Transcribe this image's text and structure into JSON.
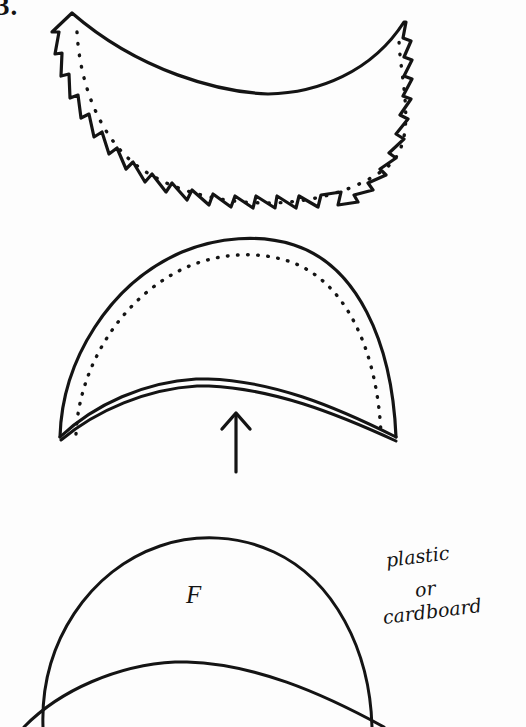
{
  "page": {
    "background_color": "#fdfdfd",
    "ink_color": "#141414",
    "width": 526,
    "height": 727
  },
  "figure_number": "3.",
  "annotations": {
    "piece_label": "F",
    "material_note_line1": "plastic",
    "material_note_line2": "or",
    "material_note_line3": "cardboard",
    "material_note_full": "plastic or cardboard",
    "arrow_label": "up-arrow"
  },
  "figures": [
    {
      "id": "figure-top",
      "name": "notched-crescent-piece",
      "description": "Crescent/bowl shaped fabric piece with smooth concave upper edge and clipped (notched) lower curved seam allowance, with dotted stitching line inside",
      "has_dotted_seam_line": true,
      "has_clipping_notches": true,
      "notch_count": 18
    },
    {
      "id": "figure-middle",
      "name": "turned-dome-piece",
      "description": "Dome shaped piece with dotted stitching line following the upper curve and a double-line inner curve along the lower edge, indicating a turned and pressed edge",
      "has_dotted_seam_line": true,
      "has_double_inner_curve": true,
      "arrow_points_to": "lower inner curved edge"
    },
    {
      "id": "figure-bottom",
      "name": "stiffener-template-piece",
      "description": "Plain dome shaped template piece with a second inner arc, labelled F, cut off by the bottom edge of the page",
      "has_dotted_seam_line": false,
      "cropped_at_page_bottom": true
    }
  ]
}
